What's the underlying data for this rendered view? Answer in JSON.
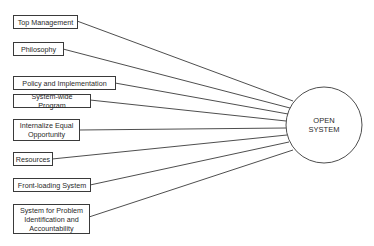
{
  "diagram": {
    "inputs": [
      {
        "label": "Top Management"
      },
      {
        "label": "Philosophy"
      },
      {
        "label": "Policy and Implementation"
      },
      {
        "label": "System-wide Program"
      },
      {
        "label": "Internalize Equal\nOpportunity"
      },
      {
        "label": "Resources"
      },
      {
        "label": "Front-loading System"
      },
      {
        "label": "System for Problem\nIdentification and\nAccountability"
      }
    ],
    "target": {
      "label": "OPEN\nSYSTEM"
    },
    "colors": {
      "stroke": "#3a3a3a",
      "background": "#ffffff"
    }
  }
}
